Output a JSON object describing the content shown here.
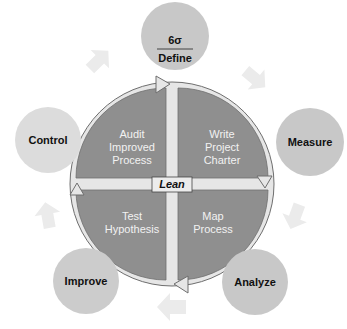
{
  "colors": {
    "background": "#ffffff",
    "outer_circle": "#c8c8c8",
    "center_quadrant": "#8f8f8f",
    "ring_arrow": "#e6e6e6",
    "ring_arrow_outline": "#6e6e6e",
    "faint_arrow": "#ebebeb",
    "cross_divider": "#ececec"
  },
  "outer_phases": [
    {
      "id": "define",
      "prefix": "6σ",
      "label": "Define"
    },
    {
      "id": "measure",
      "label": "Measure"
    },
    {
      "id": "analyze",
      "label": "Analyze"
    },
    {
      "id": "improve",
      "label": "Improve"
    },
    {
      "id": "control",
      "label": "Control"
    }
  ],
  "center": {
    "label": "Lean",
    "quadrants": {
      "top_right": [
        "Write",
        "Project",
        "Charter"
      ],
      "bottom_right": [
        "Map",
        "Process"
      ],
      "bottom_left": [
        "Test",
        "Hypothesis"
      ],
      "top_left": [
        "Audit",
        "Improved",
        "Process"
      ]
    }
  }
}
